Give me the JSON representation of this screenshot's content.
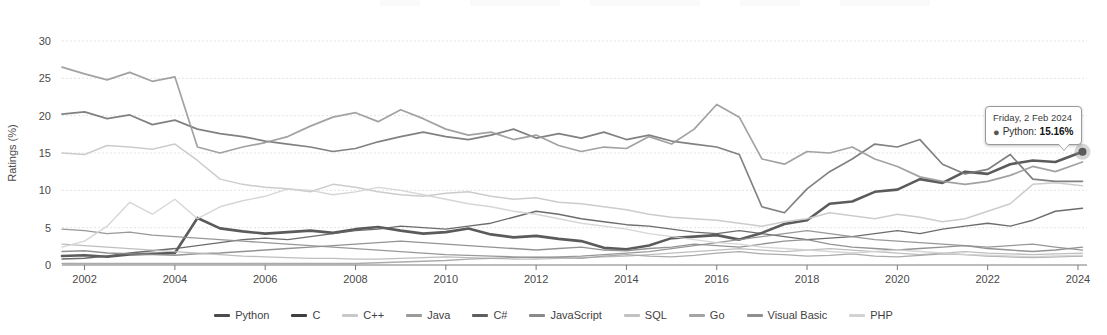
{
  "chart_data": {
    "type": "line",
    "title": "",
    "xlabel": "",
    "ylabel": "Ratings (%)",
    "xlim": [
      2001.5,
      2024.2
    ],
    "ylim": [
      0,
      30
    ],
    "yticks": [
      0,
      5,
      10,
      15,
      20,
      25,
      30
    ],
    "xticks": [
      2002,
      2004,
      2006,
      2008,
      2010,
      2012,
      2014,
      2016,
      2018,
      2020,
      2022,
      2024
    ],
    "grid": true,
    "legend_position": "bottom",
    "x": [
      2001.5,
      2002,
      2002.5,
      2003,
      2003.5,
      2004,
      2004.5,
      2005,
      2005.5,
      2006,
      2006.5,
      2007,
      2007.5,
      2008,
      2008.5,
      2009,
      2009.5,
      2010,
      2010.5,
      2011,
      2011.5,
      2012,
      2012.5,
      2013,
      2013.5,
      2014,
      2014.5,
      2015,
      2015.5,
      2016,
      2016.5,
      2017,
      2017.5,
      2018,
      2018.5,
      2019,
      2019.5,
      2020,
      2020.5,
      2021,
      2021.5,
      2022,
      2022.5,
      2023,
      2023.5,
      2024.1
    ],
    "series": [
      {
        "name": "Python",
        "color": "#4d4d4d",
        "width": 2.6,
        "values": [
          1.2,
          1.3,
          1.1,
          1.4,
          1.5,
          1.6,
          6.3,
          4.9,
          4.5,
          4.2,
          4.4,
          4.6,
          4.3,
          4.8,
          5.1,
          4.6,
          4.2,
          4.4,
          4.9,
          4.1,
          3.7,
          3.9,
          3.5,
          3.2,
          2.3,
          2.1,
          2.6,
          3.6,
          3.8,
          4.0,
          3.4,
          4.3,
          5.5,
          6.0,
          8.2,
          8.5,
          9.8,
          10.1,
          11.5,
          11.0,
          12.5,
          12.2,
          13.5,
          14.0,
          13.8,
          15.16
        ]
      },
      {
        "name": "C",
        "color": "#767676",
        "width": 1.7,
        "values": [
          20.2,
          20.5,
          19.6,
          20.1,
          18.8,
          19.4,
          18.2,
          17.6,
          17.2,
          16.6,
          16.2,
          15.8,
          15.2,
          15.6,
          16.5,
          17.2,
          17.8,
          17.2,
          16.8,
          17.4,
          18.2,
          17.0,
          17.6,
          17.0,
          17.8,
          16.8,
          17.4,
          16.6,
          16.2,
          15.8,
          14.8,
          7.8,
          7.0,
          10.2,
          12.5,
          14.2,
          16.2,
          15.8,
          16.8,
          13.5,
          12.2,
          12.8,
          14.8,
          11.5,
          11.2,
          11.2
        ]
      },
      {
        "name": "C++",
        "color": "#c8c8c8",
        "width": 1.5,
        "values": [
          15.0,
          14.8,
          16.0,
          15.8,
          15.5,
          16.2,
          14.0,
          11.5,
          10.8,
          10.4,
          10.2,
          9.8,
          10.8,
          10.4,
          9.8,
          9.4,
          9.2,
          9.6,
          9.8,
          9.2,
          8.8,
          9.0,
          8.4,
          8.2,
          7.8,
          7.4,
          6.8,
          6.4,
          6.2,
          6.0,
          5.6,
          5.2,
          5.8,
          6.2,
          7.0,
          6.6,
          6.2,
          6.8,
          6.4,
          5.8,
          6.2,
          7.2,
          8.2,
          10.8,
          11.0,
          10.6
        ]
      },
      {
        "name": "Java",
        "color": "#9a9a9a",
        "width": 1.7,
        "values": [
          26.5,
          25.6,
          24.8,
          25.8,
          24.6,
          25.2,
          15.8,
          15.0,
          15.8,
          16.4,
          17.2,
          18.6,
          19.8,
          20.4,
          19.2,
          20.8,
          19.6,
          18.2,
          17.4,
          17.8,
          16.8,
          17.4,
          16.0,
          15.2,
          15.8,
          15.6,
          17.2,
          16.2,
          18.2,
          21.5,
          19.8,
          14.2,
          13.5,
          15.2,
          15.0,
          15.8,
          14.2,
          13.2,
          11.8,
          11.2,
          10.8,
          11.2,
          12.0,
          13.2,
          12.5,
          13.8
        ]
      },
      {
        "name": "C#",
        "color": "#5f5f5f",
        "width": 1.4,
        "values": [
          0.8,
          0.9,
          1.2,
          1.6,
          1.9,
          2.2,
          2.6,
          3.0,
          3.4,
          3.6,
          3.4,
          3.8,
          4.2,
          4.6,
          4.8,
          5.2,
          5.0,
          4.8,
          5.2,
          5.6,
          6.4,
          7.2,
          6.8,
          6.2,
          5.8,
          5.4,
          5.2,
          4.8,
          4.4,
          4.2,
          4.6,
          4.2,
          3.8,
          3.4,
          3.6,
          3.8,
          4.2,
          4.6,
          4.2,
          4.8,
          5.2,
          5.6,
          5.2,
          6.0,
          7.2,
          7.6
        ]
      },
      {
        "name": "JavaScript",
        "color": "#8a8a8a",
        "width": 1.4,
        "values": [
          1.8,
          1.9,
          1.6,
          1.5,
          1.4,
          1.3,
          1.5,
          1.6,
          1.8,
          2.0,
          2.2,
          2.4,
          2.6,
          2.8,
          3.0,
          3.2,
          3.0,
          2.8,
          2.6,
          2.4,
          2.2,
          2.0,
          2.2,
          2.4,
          2.0,
          1.9,
          2.2,
          2.4,
          2.8,
          2.6,
          2.4,
          2.8,
          3.2,
          3.4,
          2.8,
          2.4,
          2.2,
          2.0,
          2.2,
          2.4,
          2.6,
          2.2,
          2.0,
          1.8,
          2.0,
          2.4
        ]
      },
      {
        "name": "SQL",
        "color": "#b8b8b8",
        "width": 1.3,
        "values": [
          2.8,
          2.6,
          2.4,
          2.2,
          2.0,
          1.8,
          1.6,
          1.4,
          1.2,
          1.1,
          1.0,
          0.9,
          0.9,
          0.8,
          0.8,
          0.9,
          1.0,
          1.1,
          1.0,
          0.9,
          0.8,
          0.8,
          0.9,
          1.0,
          1.1,
          1.2,
          1.4,
          1.6,
          1.8,
          2.0,
          2.2,
          2.0,
          1.8,
          2.0,
          2.2,
          2.0,
          1.8,
          1.6,
          1.4,
          1.6,
          1.8,
          1.6,
          1.5,
          1.4,
          1.5,
          1.6
        ]
      },
      {
        "name": "Go",
        "color": "#a4a4a4",
        "width": 1.3,
        "values": [
          0.2,
          0.2,
          0.2,
          0.2,
          0.2,
          0.2,
          0.2,
          0.2,
          0.2,
          0.2,
          0.2,
          0.2,
          0.2,
          0.2,
          0.3,
          0.4,
          0.5,
          0.6,
          0.8,
          0.9,
          1.0,
          1.1,
          1.0,
          0.9,
          1.2,
          1.4,
          1.2,
          1.1,
          1.3,
          1.6,
          1.8,
          1.5,
          1.4,
          1.2,
          1.3,
          1.5,
          1.2,
          1.1,
          1.3,
          1.5,
          1.4,
          1.2,
          1.1,
          1.0,
          1.1,
          1.2
        ]
      },
      {
        "name": "Visual Basic",
        "color": "#8f8f8f",
        "width": 1.3,
        "values": [
          4.8,
          4.6,
          4.2,
          4.4,
          4.0,
          3.8,
          3.6,
          3.4,
          3.2,
          3.0,
          2.8,
          2.6,
          2.4,
          2.2,
          2.0,
          1.8,
          1.6,
          1.4,
          1.3,
          1.2,
          1.1,
          1.0,
          1.1,
          1.2,
          1.4,
          1.6,
          1.8,
          2.2,
          2.6,
          3.0,
          3.4,
          3.8,
          4.2,
          4.6,
          4.2,
          3.8,
          3.4,
          3.2,
          3.0,
          2.8,
          2.6,
          2.4,
          2.6,
          2.8,
          2.4,
          2.0
        ]
      },
      {
        "name": "PHP",
        "color": "#d2d2d2",
        "width": 1.4,
        "values": [
          2.4,
          3.2,
          5.2,
          8.4,
          6.8,
          8.8,
          6.2,
          7.8,
          8.6,
          9.2,
          10.2,
          10.0,
          9.4,
          9.8,
          10.4,
          10.0,
          9.4,
          8.8,
          8.2,
          7.8,
          7.2,
          6.8,
          6.2,
          5.6,
          5.2,
          4.8,
          4.2,
          3.8,
          3.4,
          3.0,
          2.8,
          2.4,
          2.2,
          2.0,
          1.8,
          1.6,
          1.8,
          2.0,
          1.8,
          1.6,
          1.4,
          1.3,
          1.2,
          1.1,
          1.2,
          1.3
        ]
      }
    ]
  },
  "legend": {
    "items": [
      {
        "label": "Python",
        "color": "#4d4d4d"
      },
      {
        "label": "C",
        "color": "#3f3f3f"
      },
      {
        "label": "C++",
        "color": "#c8c8c8"
      },
      {
        "label": "Java",
        "color": "#9a9a9a"
      },
      {
        "label": "C#",
        "color": "#5f5f5f"
      },
      {
        "label": "JavaScript",
        "color": "#8a8a8a"
      },
      {
        "label": "SQL",
        "color": "#c2c2c2"
      },
      {
        "label": "Go",
        "color": "#a4a4a4"
      },
      {
        "label": "Visual Basic",
        "color": "#8f8f8f"
      },
      {
        "label": "PHP",
        "color": "#d2d2d2"
      }
    ]
  },
  "tooltip": {
    "date": "Friday, 2 Feb 2024",
    "bullet": "●",
    "series_name": "Python:",
    "value": "15.16%"
  }
}
